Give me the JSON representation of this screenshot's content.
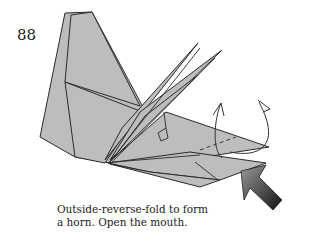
{
  "step": {
    "number": "88",
    "caption_lines": [
      "Outside-reverse-fold to form",
      "a horn. Open the mouth."
    ]
  },
  "diagram": {
    "paper_color": "#bdbdbd",
    "line_color": "#2a2a2a",
    "arrow_color": "#333333",
    "symbols": [
      "outside-reverse-fold-arrow",
      "open-mouth-arrow",
      "push-arrow"
    ]
  }
}
